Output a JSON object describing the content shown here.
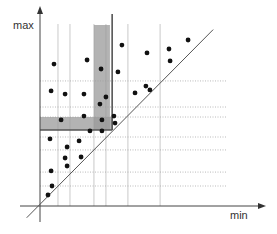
{
  "chart_data": {
    "type": "scatter",
    "title": "",
    "xlabel": "min",
    "ylabel": "max",
    "xlim": [
      0,
      100
    ],
    "ylim": [
      0,
      100
    ],
    "grid": "partial dotted",
    "diagonal": {
      "label": "",
      "from": [
        -6,
        -6
      ],
      "to": [
        78,
        90
      ]
    },
    "query_point": {
      "x": 32.5,
      "y": 38.8
    },
    "vertical_grid_x": [
      8.1,
      13.5,
      24.3,
      29.7,
      39.6,
      54.1
    ],
    "horizontal_grid_y": [
      10.2,
      17.3,
      28.6,
      35.2,
      45.4,
      50.5,
      63.8
    ],
    "band_x": [
      24.3,
      31.5
    ],
    "band_y": [
      38.8,
      45.4
    ],
    "points": [
      {
        "x": 6.3,
        "y": 72.4
      },
      {
        "x": 21.2,
        "y": 74.5
      },
      {
        "x": 27.5,
        "y": 69.9
      },
      {
        "x": 35.1,
        "y": 68.4
      },
      {
        "x": 36.9,
        "y": 82.1
      },
      {
        "x": 48.2,
        "y": 78.1
      },
      {
        "x": 58.1,
        "y": 80.1
      },
      {
        "x": 58.6,
        "y": 74.0
      },
      {
        "x": 66.7,
        "y": 84.7
      },
      {
        "x": 5.0,
        "y": 58.7
      },
      {
        "x": 11.3,
        "y": 57.1
      },
      {
        "x": 19.8,
        "y": 57.1
      },
      {
        "x": 27.0,
        "y": 52.0
      },
      {
        "x": 29.7,
        "y": 55.6
      },
      {
        "x": 42.8,
        "y": 57.7
      },
      {
        "x": 47.7,
        "y": 61.2
      },
      {
        "x": 49.5,
        "y": 59.2
      },
      {
        "x": 9.5,
        "y": 43.9
      },
      {
        "x": 19.8,
        "y": 45.9
      },
      {
        "x": 27.9,
        "y": 43.9
      },
      {
        "x": 33.3,
        "y": 45.9
      },
      {
        "x": 33.8,
        "y": 42.3
      },
      {
        "x": 22.5,
        "y": 38.3
      },
      {
        "x": 27.9,
        "y": 38.3
      },
      {
        "x": 4.5,
        "y": 34.2
      },
      {
        "x": 17.6,
        "y": 33.2
      },
      {
        "x": 12.2,
        "y": 30.1
      },
      {
        "x": 18.5,
        "y": 25.0
      },
      {
        "x": 11.3,
        "y": 24.5
      },
      {
        "x": 12.2,
        "y": 20.4
      },
      {
        "x": 5.0,
        "y": 17.9
      },
      {
        "x": 5.4,
        "y": 10.2
      },
      {
        "x": 3.6,
        "y": 5.6
      }
    ]
  }
}
